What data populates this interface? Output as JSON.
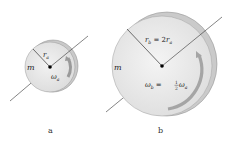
{
  "diagram": {
    "disk_a": {
      "mass_label": "m",
      "radius_label": "r",
      "radius_sub": "a",
      "omega_label": "ω",
      "omega_sub": "a",
      "caption": "a"
    },
    "disk_b": {
      "mass_label": "m",
      "radius_label": "r",
      "radius_sub": "b",
      "radius_eq": " = 2",
      "radius_eq_var": "r",
      "radius_eq_sub": "a",
      "omega_label": "ω",
      "omega_sub": "b",
      "omega_eq": " = ",
      "omega_frac_num": "1",
      "omega_frac_den": "2",
      "omega_eq_var": "ω",
      "omega_eq_sub": "a",
      "caption": "b"
    },
    "colors": {
      "disk_face": "#e6e6e6",
      "disk_rim": "#c8c8c8",
      "arrow": "#9a9a9a",
      "line": "#333333"
    }
  }
}
